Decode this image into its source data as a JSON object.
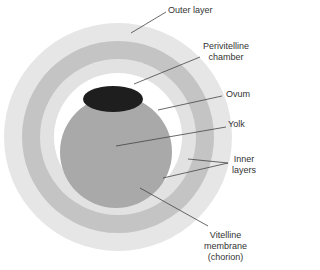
{
  "diagram": {
    "type": "egg cross-section",
    "labels": {
      "outer_layer": "Outer layer",
      "perivitelline_1": "Perivitelline",
      "perivitelline_2": "chamber",
      "ovum": "Ovum",
      "yolk": "Yolk",
      "inner_1": "Inner",
      "inner_2": "layers",
      "vitelline_1": "Vitelline",
      "vitelline_2": "membrane",
      "vitelline_3": "(chorion)"
    },
    "colors": {
      "outer_ring": "#e6e6e6",
      "middle_ring": "#c4c4c4",
      "inner_ring": "#e2e2e2",
      "perivitelline": "#ffffff",
      "yolk": "#a9a9a9",
      "ovum": "#1e1e1e",
      "leader": "#444444"
    }
  }
}
